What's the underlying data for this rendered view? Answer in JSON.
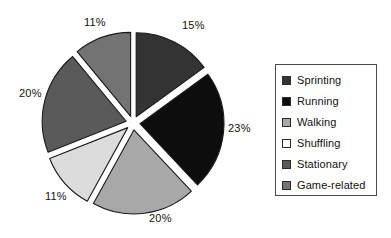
{
  "chart_data": {
    "type": "pie",
    "title": "",
    "exploded": true,
    "legend_position": "right",
    "categories": [
      "Sprinting",
      "Running",
      "Walking",
      "Shuffling",
      "Stationary",
      "Game-related"
    ],
    "values": [
      15,
      23,
      20,
      11,
      20,
      11
    ],
    "labels": [
      "15%",
      "23%",
      "20%",
      "11%",
      "20%",
      "11%"
    ],
    "colors": [
      "#333333",
      "#0d0d0d",
      "#a8a8a8",
      "#dcdcdc",
      "#5a5a5a",
      "#737373"
    ],
    "slices": [
      {
        "name": "Sprinting",
        "value": 15,
        "label": "15%",
        "color": "#333333"
      },
      {
        "name": "Running",
        "value": 23,
        "label": "23%",
        "color": "#0d0d0d"
      },
      {
        "name": "Walking",
        "value": 20,
        "label": "20%",
        "color": "#a8a8a8"
      },
      {
        "name": "Shuffling",
        "value": 11,
        "label": "11%",
        "color": "#dcdcdc"
      },
      {
        "name": "Stationary",
        "value": 20,
        "label": "20%",
        "color": "#5a5a5a"
      },
      {
        "name": "Game-related",
        "value": 11,
        "label": "11%",
        "color": "#737373"
      }
    ],
    "total": 100,
    "xlabel": "",
    "ylabel": ""
  },
  "legend": {
    "entries": [
      {
        "label": "Sprinting",
        "color": "#333333"
      },
      {
        "label": "Running",
        "color": "#0d0d0d"
      },
      {
        "label": "Walking",
        "color": "#a8a8a8"
      },
      {
        "label": "Shuffling",
        "color": "#ffffff"
      },
      {
        "label": "Stationary",
        "color": "#5a5a5a"
      },
      {
        "label": "Game-related",
        "color": "#737373"
      }
    ]
  },
  "pie_labels": {
    "sprinting": "15%",
    "running": "23%",
    "walking": "20%",
    "shuffling": "11%",
    "stationary": "20%",
    "game_related": "11%"
  }
}
